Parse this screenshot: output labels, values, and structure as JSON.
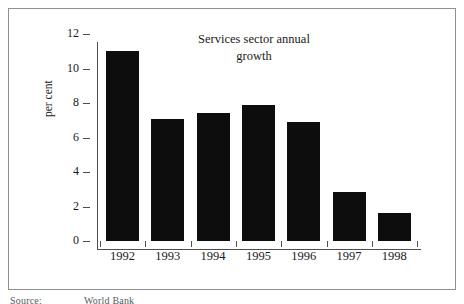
{
  "figure": {
    "title_line1": "Services sector annual",
    "title_line2": "growth",
    "source_label": "Source:",
    "source_value": "World Bank",
    "frame_color": "#8e9194",
    "bar_color": "#0d0d0d",
    "axis_color": "#4d4d4d",
    "text_color": "#1a1a1a"
  },
  "chart_data": {
    "type": "bar",
    "title": "Services sector annual growth",
    "xlabel": "",
    "ylabel": "per cent",
    "categories": [
      "1992",
      "1993",
      "1994",
      "1995",
      "1996",
      "1997",
      "1998"
    ],
    "values": [
      11.0,
      7.1,
      7.4,
      7.9,
      6.9,
      2.85,
      1.65
    ],
    "ylim": [
      0,
      12
    ],
    "yticks": [
      0,
      2,
      4,
      6,
      8,
      10,
      12
    ],
    "ytick_labels": [
      "0",
      "2",
      "4",
      "6",
      "8",
      "10",
      "12"
    ],
    "grid": false,
    "legend": null,
    "series": [
      {
        "name": "Services sector annual growth",
        "values": [
          11.0,
          7.1,
          7.4,
          7.9,
          6.9,
          2.85,
          1.65
        ]
      }
    ]
  }
}
